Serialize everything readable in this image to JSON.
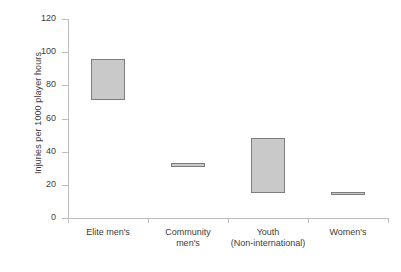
{
  "chart_data": {
    "type": "bar",
    "title": "",
    "subtitle": "",
    "xlabel": "",
    "ylabel": "Injuries per 1000 player hours",
    "ylim": [
      0,
      120
    ],
    "yticks": [
      0,
      20,
      40,
      60,
      80,
      100,
      120
    ],
    "ytick_labels": [
      "0",
      "20",
      "40",
      "60",
      "80",
      "100",
      "120"
    ],
    "grid": false,
    "legend": "none",
    "bar_style": {
      "fill": "#c9c9c9",
      "border": "#7d7d7d"
    },
    "categories": [
      "Elite men's",
      "Community men's",
      "Youth (Non-international)",
      "Women's"
    ],
    "category_lines": [
      [
        "Elite men's",
        ""
      ],
      [
        "Community",
        "men's"
      ],
      [
        "Youth",
        "(Non-international)"
      ],
      [
        "Women's",
        ""
      ]
    ],
    "ranges": [
      {
        "category": "Elite men's",
        "low": 71,
        "high": 96
      },
      {
        "category": "Community men's",
        "low": 31,
        "high": 33
      },
      {
        "category": "Youth (Non-international)",
        "low": 15,
        "high": 48
      },
      {
        "category": "Women's",
        "low": 14,
        "high": 15.5
      }
    ],
    "values": [
      {
        "low": 71,
        "high": 96
      },
      {
        "low": 31,
        "high": 33
      },
      {
        "low": 15,
        "high": 48
      },
      {
        "low": 14,
        "high": 15.5
      }
    ]
  }
}
